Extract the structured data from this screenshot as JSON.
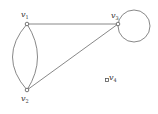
{
  "graph": {
    "vertices": [
      {
        "id": "v1",
        "label": "v",
        "sub": "1",
        "x": 27,
        "y": 24
      },
      {
        "id": "v2",
        "label": "v",
        "sub": "2",
        "x": 27,
        "y": 90
      },
      {
        "id": "v3",
        "label": "v",
        "sub": "3",
        "x": 118,
        "y": 24
      },
      {
        "id": "v4",
        "label": "v",
        "sub": "4",
        "x": 107,
        "y": 80
      }
    ],
    "edges": [
      {
        "from": "v1",
        "to": "v3",
        "type": "straight"
      },
      {
        "from": "v2",
        "to": "v3",
        "type": "straight"
      },
      {
        "from": "v1",
        "to": "v2",
        "type": "curve-left"
      },
      {
        "from": "v1",
        "to": "v2",
        "type": "curve-right"
      },
      {
        "from": "v3",
        "to": "v3",
        "type": "loop"
      }
    ]
  }
}
